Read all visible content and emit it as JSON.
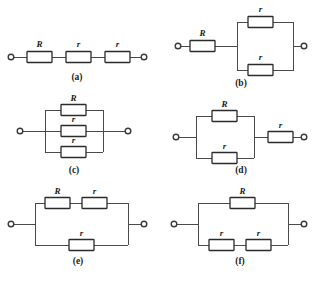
{
  "figure": {
    "background_color": "#ffffff",
    "wire_color": "#4a4a4a",
    "resistor_outline_color": "#2b2b2b",
    "resistor_fill_color": "#ffffff",
    "label_color": "#1c1c1c"
  },
  "panels": [
    {
      "id": "a",
      "caption": "(a)",
      "topology": "series",
      "description": "R, r and r connected in series between the two terminals",
      "resistors": [
        {
          "label": "R",
          "branch": "main"
        },
        {
          "label": "r",
          "branch": "main"
        },
        {
          "label": "r",
          "branch": "main"
        }
      ]
    },
    {
      "id": "b",
      "caption": "(b)",
      "topology": "series-then-parallel",
      "description": "R in series with two r resistors connected in parallel",
      "resistors": [
        {
          "label": "R",
          "branch": "series"
        },
        {
          "label": "r",
          "branch": "parallel-top"
        },
        {
          "label": "r",
          "branch": "parallel-bottom"
        }
      ]
    },
    {
      "id": "c",
      "caption": "(c)",
      "topology": "parallel",
      "description": "R, r and r all connected in parallel between the two terminals",
      "resistors": [
        {
          "label": "R",
          "branch": "parallel-top"
        },
        {
          "label": "r",
          "branch": "parallel-middle"
        },
        {
          "label": "r",
          "branch": "parallel-bottom"
        }
      ]
    },
    {
      "id": "d",
      "caption": "(d)",
      "topology": "parallel-then-series",
      "description": "R in parallel with r, that combination in series with a second r",
      "resistors": [
        {
          "label": "R",
          "branch": "parallel-top"
        },
        {
          "label": "r",
          "branch": "parallel-bottom"
        },
        {
          "label": "r",
          "branch": "series"
        }
      ]
    },
    {
      "id": "e",
      "caption": "(e)",
      "topology": "two-branch-parallel",
      "description": "R and r in series on the top branch, in parallel with a single r on the bottom branch",
      "resistors": [
        {
          "label": "R",
          "branch": "top"
        },
        {
          "label": "r",
          "branch": "top"
        },
        {
          "label": "r",
          "branch": "bottom"
        }
      ]
    },
    {
      "id": "f",
      "caption": "(f)",
      "topology": "two-branch-parallel",
      "description": "R alone on the top branch, in parallel with two r resistors in series on the bottom branch",
      "resistors": [
        {
          "label": "R",
          "branch": "top"
        },
        {
          "label": "r",
          "branch": "bottom"
        },
        {
          "label": "r",
          "branch": "bottom"
        }
      ]
    }
  ],
  "labels": {
    "a_R": "R",
    "a_r1": "r",
    "a_r2": "r",
    "b_R": "R",
    "b_r_top": "r",
    "b_r_bottom": "r",
    "c_R": "R",
    "c_r_mid": "r",
    "c_r_bottom": "r",
    "d_R": "R",
    "d_r_bottom": "r",
    "d_r_series": "r",
    "e_R": "R",
    "e_r_top": "r",
    "e_r_bottom": "r",
    "f_R": "R",
    "f_r_left": "r",
    "f_r_right": "r"
  },
  "captions": {
    "a": "(a)",
    "b": "(b)",
    "c": "(c)",
    "d": "(d)",
    "e": "(e)",
    "f": "(f)"
  }
}
